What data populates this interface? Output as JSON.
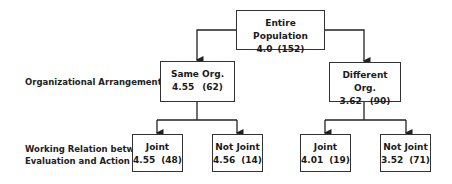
{
  "diagram": {
    "row_labels": {
      "level1": "Organizational Arrangements",
      "level2_line1": "Working Relation between",
      "level2_line2": "Evaluation and Action"
    },
    "nodes": {
      "root": {
        "title": "Entire Population",
        "value": "4.0",
        "n": "(152)"
      },
      "same_org": {
        "title": "Same Org.",
        "value": "4.55",
        "n": "(62)"
      },
      "different_org": {
        "title": "Different Org.",
        "value": "3.62",
        "n": "(90)"
      },
      "same_joint": {
        "title": "Joint",
        "value": "4.55",
        "n": "(48)"
      },
      "same_not_joint": {
        "title": "Not Joint",
        "value": "4.56",
        "n": "(14)"
      },
      "diff_joint": {
        "title": "Joint",
        "value": "4.01",
        "n": "(19)"
      },
      "diff_not_joint": {
        "title": "Not Joint",
        "value": "3.52",
        "n": "(71)"
      }
    },
    "line_color": "#333333"
  }
}
